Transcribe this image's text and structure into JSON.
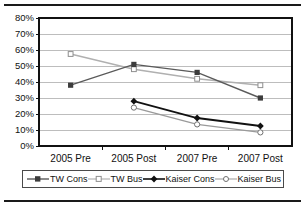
{
  "title": "",
  "chart_data": {
    "type": "line",
    "title": "",
    "xlabel": "",
    "ylabel": "",
    "ylim": [
      0,
      80
    ],
    "ytick_step": 10,
    "grid": true,
    "legend_position": "bottom",
    "categories": [
      "2005 Pre",
      "2005 Post",
      "2007 Pre",
      "2007 Post"
    ],
    "ytick_labels": [
      "80%",
      "70%",
      "60%",
      "50%",
      "40%",
      "30%",
      "20%",
      "10%",
      "0%"
    ],
    "series": [
      {
        "name": "TW Cons",
        "marker": "filled-square",
        "color": "#5a5a5a",
        "values": [
          38,
          51,
          46,
          30
        ]
      },
      {
        "name": "TW Bus",
        "marker": "open-square",
        "color": "#b0b0b0",
        "values": [
          57.5,
          48,
          42,
          38
        ]
      },
      {
        "name": "Kaiser Cons",
        "marker": "filled-diamond",
        "color": "#111111",
        "values": [
          null,
          28,
          17.5,
          12.5
        ]
      },
      {
        "name": "Kaiser Bus",
        "marker": "open-circle",
        "color": "#9a9a9a",
        "values": [
          null,
          24,
          13.5,
          8.5
        ]
      }
    ]
  },
  "legend": {
    "items": [
      {
        "label": "TW Cons"
      },
      {
        "label": "TW Bus"
      },
      {
        "label": "Kaiser Cons"
      },
      {
        "label": "Kaiser Bus"
      }
    ]
  },
  "colors": {
    "tw_cons": "#5a5a5a",
    "tw_bus": "#b0b0b0",
    "kaiser_cons": "#111111",
    "kaiser_bus": "#9a9a9a",
    "grid": "#bdbdbd",
    "axis": "#111111"
  }
}
